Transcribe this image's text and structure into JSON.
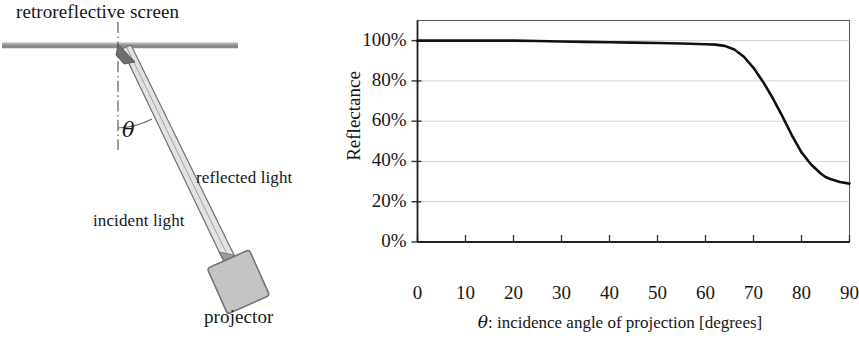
{
  "figure": {
    "schematic": {
      "screen_label": "retroreflective screen",
      "reflected_label": "reflected light",
      "incident_label": "incident light",
      "projector_label": "projector",
      "angle_label": "θ",
      "colors": {
        "screen": "#8c8c8c",
        "beam_outline": "#6f6f6f",
        "beam_fill": "#d8d8d8",
        "projector_fill": "#c3c3c3",
        "projector_stroke": "#5a5a5a",
        "axis_dashdot": "#6a6a6a",
        "arc": "#6a6a6a",
        "text": "#161616"
      }
    },
    "chart_data": {
      "type": "line",
      "title": "",
      "xlabel": "θ: incidence angle of  projection [degrees]",
      "xlabel_symbol": "θ",
      "xlabel_rest": ": incidence angle of  projection [degrees]",
      "ylabel": "Reflectance",
      "xlim": [
        0,
        90
      ],
      "ylim": [
        0,
        110
      ],
      "xticks": [
        0,
        10,
        20,
        30,
        40,
        50,
        60,
        70,
        80,
        90
      ],
      "xticklabels": [
        "0",
        "10",
        "20",
        "30",
        "40",
        "50",
        "60",
        "70",
        "80",
        "90"
      ],
      "yticks": [
        0,
        20,
        40,
        60,
        80,
        100
      ],
      "yticklabels": [
        "0%",
        "20%",
        "40%",
        "60%",
        "80%",
        "100%"
      ],
      "grid": "horizontal",
      "legend": "none",
      "series": [
        {
          "name": "Reflectance",
          "color": "#111111",
          "linewidth": 2.6,
          "x": [
            0,
            5,
            10,
            15,
            20,
            25,
            30,
            35,
            40,
            45,
            50,
            55,
            60,
            62,
            64,
            66,
            68,
            70,
            72,
            74,
            76,
            78,
            80,
            82,
            84,
            85,
            86,
            88,
            90
          ],
          "y": [
            100,
            100,
            100,
            100,
            100,
            99.8,
            99.6,
            99.4,
            99.2,
            99,
            98.8,
            98.6,
            98.2,
            98,
            97.4,
            95.6,
            92,
            86.5,
            79.5,
            71.5,
            62.5,
            53,
            44.5,
            38.5,
            34,
            32.3,
            31.3,
            29.8,
            29
          ]
        }
      ]
    }
  }
}
